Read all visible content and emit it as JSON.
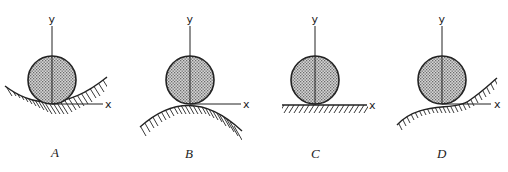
{
  "diagram": {
    "colors": {
      "ink": "#222222",
      "ball_fill": "#bdbdbd",
      "background": "#ffffff"
    },
    "panels": [
      {
        "id": "A",
        "label": "A",
        "surface": "concave (ball in a valley)",
        "y_axis_label": "y",
        "x_axis_label": "x"
      },
      {
        "id": "B",
        "label": "B",
        "surface": "convex (ball on a hilltop)",
        "y_axis_label": "y",
        "x_axis_label": "x"
      },
      {
        "id": "C",
        "label": "C",
        "surface": "flat",
        "y_axis_label": "y",
        "x_axis_label": "x"
      },
      {
        "id": "D",
        "label": "D",
        "surface": "inflection (saddle-like S-curve)",
        "y_axis_label": "y",
        "x_axis_label": "x"
      }
    ]
  }
}
